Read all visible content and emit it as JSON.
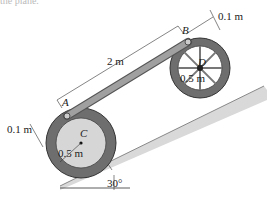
{
  "caption_fragment": "the plane.",
  "labels": {
    "A": "A",
    "B": "B",
    "C": "C",
    "D": "D",
    "bar_length": "2 m",
    "offset_top": "0.1 m",
    "offset_left": "0.1 m",
    "radius_C": "0.5 m",
    "radius_D": "0.5 m",
    "angle": "30°"
  },
  "colors": {
    "tire": "#6e6e6e",
    "hub_C": "#d6d6d6",
    "bar": "#9a9a9a",
    "incline": "#d9d9d9",
    "line": "#333333"
  }
}
